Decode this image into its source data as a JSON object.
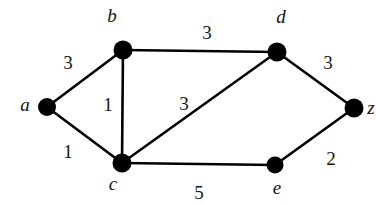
{
  "figure": {
    "kind": "weighted-undirected-graph",
    "background_color": "#ffffff",
    "ink_color": "#000000",
    "width": 376,
    "height": 205
  },
  "nodes": [
    {
      "id": "a",
      "label": "a",
      "cx": 47,
      "cy": 107,
      "r": 9,
      "label_x": 25,
      "label_y": 104
    },
    {
      "id": "b",
      "label": "b",
      "cx": 123,
      "cy": 50,
      "r": 9.5,
      "label_x": 112,
      "label_y": 15
    },
    {
      "id": "c",
      "label": "c",
      "cx": 122,
      "cy": 163,
      "r": 9.5,
      "label_x": 113,
      "label_y": 183
    },
    {
      "id": "d",
      "label": "d",
      "cx": 277,
      "cy": 52,
      "r": 9.5,
      "label_x": 281,
      "label_y": 16
    },
    {
      "id": "e",
      "label": "e",
      "cx": 275,
      "cy": 165,
      "r": 8.5,
      "label_x": 277,
      "label_y": 187
    },
    {
      "id": "z",
      "label": "z",
      "cx": 354,
      "cy": 108,
      "r": 9.5,
      "label_x": 371,
      "label_y": 107
    }
  ],
  "edges": [
    {
      "id": "a-b",
      "from": "a",
      "to": "b",
      "weight": "3",
      "weight_x": 68,
      "weight_y": 62
    },
    {
      "id": "a-c",
      "from": "a",
      "to": "c",
      "weight": "1",
      "weight_x": 68,
      "weight_y": 151
    },
    {
      "id": "b-c",
      "from": "b",
      "to": "c",
      "weight": "1",
      "weight_x": 108,
      "weight_y": 104
    },
    {
      "id": "b-d",
      "from": "b",
      "to": "d",
      "weight": "3",
      "weight_x": 207,
      "weight_y": 32
    },
    {
      "id": "c-d",
      "from": "c",
      "to": "d",
      "weight": "3",
      "weight_x": 184,
      "weight_y": 103
    },
    {
      "id": "c-e",
      "from": "c",
      "to": "e",
      "weight": "5",
      "weight_x": 199,
      "weight_y": 192
    },
    {
      "id": "d-z",
      "from": "d",
      "to": "z",
      "weight": "3",
      "weight_x": 328,
      "weight_y": 62
    },
    {
      "id": "e-z",
      "from": "e",
      "to": "z",
      "weight": "2",
      "weight_x": 331,
      "weight_y": 158
    }
  ],
  "chart_data": {
    "type": "diagram",
    "title": "",
    "vertices": [
      "a",
      "b",
      "c",
      "d",
      "e",
      "z"
    ],
    "edge_list": [
      {
        "u": "a",
        "v": "b",
        "w": 3
      },
      {
        "u": "a",
        "v": "c",
        "w": 1
      },
      {
        "u": "b",
        "v": "c",
        "w": 1
      },
      {
        "u": "b",
        "v": "d",
        "w": 3
      },
      {
        "u": "c",
        "v": "d",
        "w": 3
      },
      {
        "u": "c",
        "v": "e",
        "w": 5
      },
      {
        "u": "d",
        "v": "z",
        "w": 3
      },
      {
        "u": "e",
        "v": "z",
        "w": 2
      }
    ]
  }
}
